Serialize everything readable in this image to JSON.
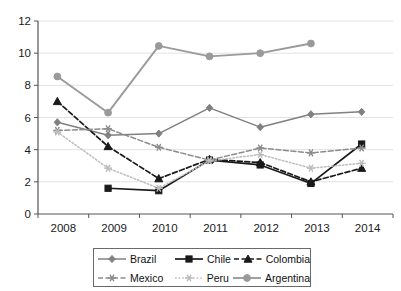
{
  "chart_data": {
    "type": "line",
    "title": "",
    "xlabel": "",
    "ylabel": "",
    "categories": [
      "2008",
      "2009",
      "2010",
      "2011",
      "2012",
      "2013",
      "2014"
    ],
    "x": [
      2008,
      2009,
      2010,
      2011,
      2012,
      2013,
      2014
    ],
    "ylim": [
      0,
      12
    ],
    "yticks": [
      0,
      2,
      4,
      6,
      8,
      10,
      12
    ],
    "grid": "horizontal",
    "legend_position": "bottom",
    "series": [
      {
        "name": "Brazil",
        "marker": "diamond",
        "line": "solid",
        "color": "#808080",
        "values": [
          5.7,
          4.9,
          5.0,
          6.6,
          5.4,
          6.2,
          6.35
        ]
      },
      {
        "name": "Chile",
        "marker": "square",
        "line": "solid",
        "color": "#1a1a1a",
        "values": [
          null,
          1.6,
          1.45,
          3.35,
          3.05,
          1.9,
          4.35
        ]
      },
      {
        "name": "Colombia",
        "marker": "triangle",
        "line": "dashed",
        "color": "#1a1a1a",
        "values": [
          7.0,
          4.2,
          2.2,
          3.4,
          3.2,
          2.0,
          2.85
        ]
      },
      {
        "name": "Mexico",
        "marker": "asterisk",
        "line": "dashed",
        "color": "#8c8c8c",
        "values": [
          5.2,
          5.3,
          4.15,
          3.35,
          4.1,
          3.8,
          4.1
        ]
      },
      {
        "name": "Peru",
        "marker": "asterisk",
        "line": "dotted",
        "color": "#bdbdbd",
        "values": [
          5.1,
          2.85,
          1.6,
          3.3,
          3.7,
          2.85,
          3.15
        ]
      },
      {
        "name": "Argentina",
        "marker": "circle",
        "line": "solid",
        "color": "#9a9a9a",
        "values": [
          8.55,
          6.3,
          10.45,
          9.8,
          10.0,
          10.6,
          null
        ]
      }
    ]
  },
  "legend": {
    "rows": [
      [
        "Brazil",
        "Chile",
        "Colombia"
      ],
      [
        "Mexico",
        "Peru",
        "Argentina"
      ]
    ]
  },
  "colors": {
    "axis": "#555555",
    "grid": "#e2e2e2",
    "text": "#1a1a1a",
    "legend_border": "#6a6a6a"
  }
}
